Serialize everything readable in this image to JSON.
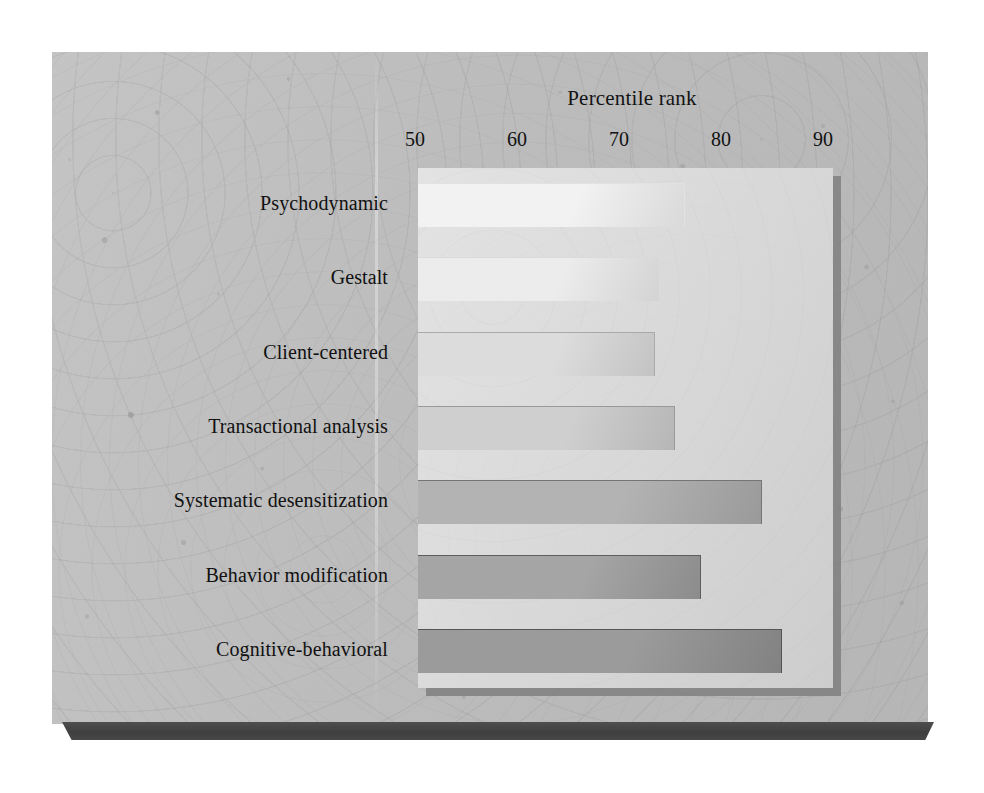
{
  "chart_data": {
    "type": "bar",
    "orientation": "horizontal",
    "title": "Percentile rank",
    "xlabel": "Percentile rank",
    "ylabel": "",
    "xlim": [
      50,
      90
    ],
    "xticks": [
      50,
      60,
      70,
      80,
      90
    ],
    "xtick_labels": [
      "50",
      "60",
      "70",
      "80",
      "90"
    ],
    "grid": false,
    "legend": null,
    "categories": [
      "Psychodynamic",
      "Gestalt",
      "Client-centered",
      "Transactional analysis",
      "Systematic desensitization",
      "Behavior modification",
      "Cognitive-behavioral"
    ],
    "values": [
      76.5,
      74,
      73.5,
      75.5,
      84,
      78,
      86
    ],
    "bar_colors": [
      "#f2f2f2",
      "#ececec",
      "#dededed",
      "#d0d0d0",
      "#b4b4b4",
      "#a6a6a6",
      "#9c9c9c"
    ]
  },
  "axis": {
    "title": "Percentile rank",
    "ticks": [
      {
        "label": "50",
        "value": 50,
        "has_mark": false
      },
      {
        "label": "60",
        "value": 60,
        "has_mark": true
      },
      {
        "label": "70",
        "value": 70,
        "has_mark": true
      },
      {
        "label": "80",
        "value": 80,
        "has_mark": true
      },
      {
        "label": "90",
        "value": 90,
        "has_mark": false
      }
    ]
  },
  "bars": [
    {
      "label": "Psychodynamic",
      "value": 76.5,
      "color": "#f2f2f2",
      "edge": "#e2e2e2"
    },
    {
      "label": "Gestalt",
      "value": 74.0,
      "color": "#ececec",
      "edge": "#dadada"
    },
    {
      "label": "Client-centered",
      "value": 73.5,
      "color": "#dcdcdc",
      "edge": "#a9a9a9"
    },
    {
      "label": "Transactional analysis",
      "value": 75.5,
      "color": "#cfcfcf",
      "edge": "#999999"
    },
    {
      "label": "Systematic desensitization",
      "value": 84.0,
      "color": "#b3b3b3",
      "edge": "#757575"
    },
    {
      "label": "Behavior modification",
      "value": 78.0,
      "color": "#a5a5a5",
      "edge": "#5e5e5e"
    },
    {
      "label": "Cognitive-behavioral",
      "value": 86.0,
      "color": "#9b9b9b",
      "edge": "#555555"
    }
  ],
  "colors": {
    "slab": "#bdbdbd",
    "panel": "#dcdcdc",
    "panel_shadow": "#7f7f7f",
    "slab_edge": "#424242",
    "text": "#121212"
  }
}
